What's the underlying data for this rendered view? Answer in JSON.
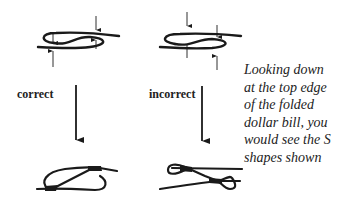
{
  "labels": {
    "correct": "correct",
    "incorrect": "incorrect"
  },
  "caption": {
    "lines": [
      "Looking down",
      "at the top edge",
      "of the folded",
      "dollar bill,  you",
      "would see the S",
      "shapes shown"
    ]
  },
  "colors": {
    "ink": "#1a1a1a",
    "background": "#ffffff"
  }
}
